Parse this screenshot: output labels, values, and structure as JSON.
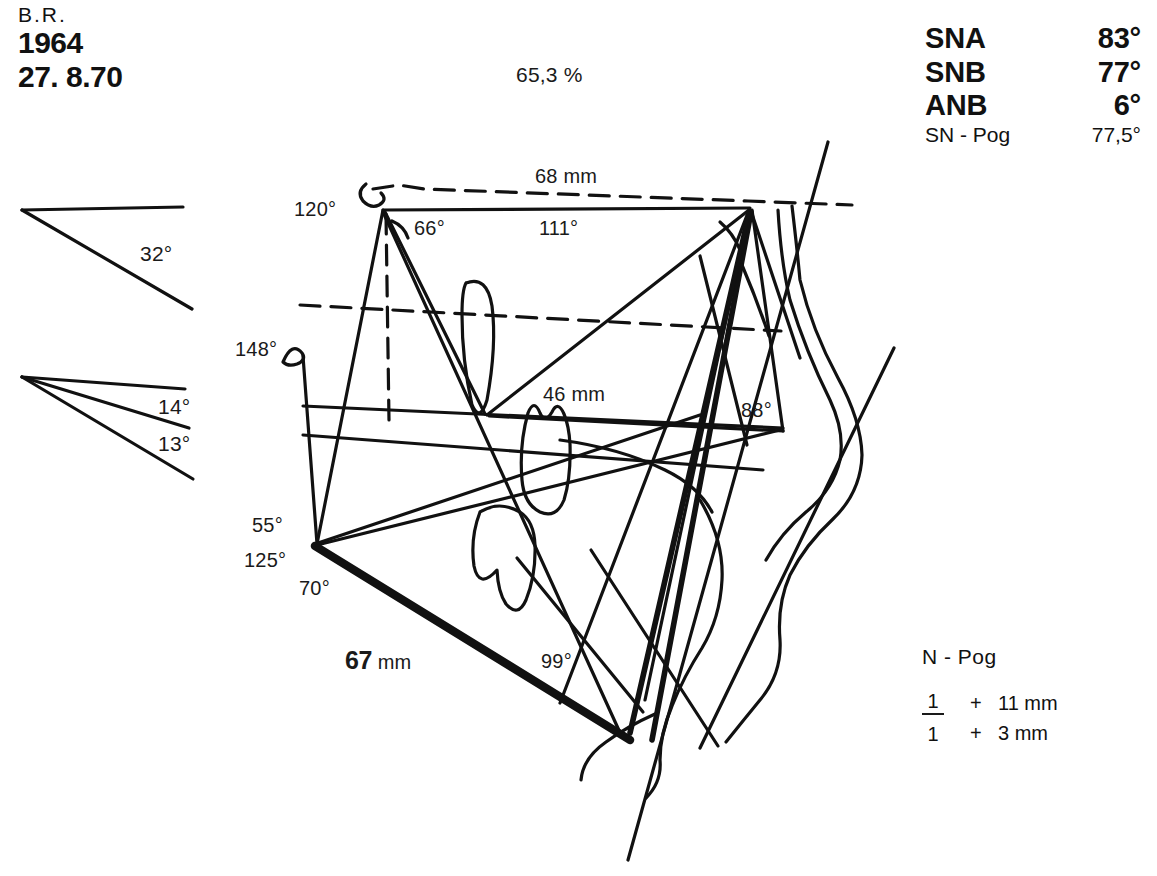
{
  "patient": {
    "initials": "B.R.",
    "birth_year": "1964",
    "record_date": "27. 8.70"
  },
  "percent_label": "65,3 %",
  "measurements": {
    "rows": [
      {
        "key": "SNA",
        "value": "83°",
        "emphasis": "bold"
      },
      {
        "key": "SNB",
        "value": "77°",
        "emphasis": "bold"
      },
      {
        "key": "ANB",
        "value": "6°",
        "emphasis": "bold"
      },
      {
        "key": "SN - Pog",
        "value": "77,5°",
        "emphasis": "plain"
      }
    ]
  },
  "npog": {
    "title": "N - Pog",
    "upper": {
      "tooth": "1",
      "sign": "+",
      "amount": "11 mm"
    },
    "lower": {
      "tooth": "1",
      "sign": "+",
      "amount": "3 mm"
    }
  },
  "angle_samples": [
    {
      "name": "upper-angle",
      "value": "32°"
    },
    {
      "name": "mid-angle",
      "value": "14°"
    },
    {
      "name": "lower-angle",
      "value": "13°"
    }
  ],
  "tracing_labels": {
    "a120": "120°",
    "a66": "66°",
    "a111": "111°",
    "a148": "148°",
    "a88": "88°",
    "a55": "55°",
    "a125": "125°",
    "a70": "70°",
    "a99": "99°",
    "len68": "68 mm",
    "len46": "46 mm",
    "len67_value": "67",
    "len67_unit": "mm"
  },
  "colors": {
    "ink": "#111111",
    "background": "#ffffff"
  }
}
